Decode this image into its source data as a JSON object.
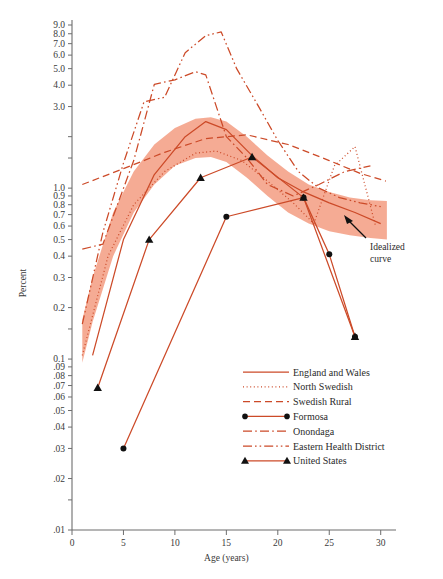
{
  "chart_data": {
    "type": "line",
    "title": "",
    "xlabel": "Age (years)",
    "ylabel": "Percent",
    "xlim": [
      0,
      31
    ],
    "ylim": [
      0.01,
      9.5
    ],
    "yscale": "log",
    "grid": false,
    "legend_position": "inside-bottom-right",
    "annotations": [
      {
        "text": "Idealized curve",
        "line1": "Idealized",
        "line2": "curve",
        "x": 30.2,
        "y": 0.47
      }
    ],
    "xticks": [
      0,
      5,
      10,
      15,
      20,
      25,
      30
    ],
    "xtick_labels": [
      "0",
      "5",
      "10",
      "15",
      "20",
      "25",
      "30"
    ],
    "yticks": [
      9.0,
      8.0,
      7.0,
      6.0,
      5.0,
      4.0,
      3.0,
      2.0,
      1.5,
      1.0,
      0.9,
      0.8,
      0.7,
      0.6,
      0.5,
      0.4,
      0.3,
      0.2,
      0.15,
      0.1,
      0.09,
      0.08,
      0.07,
      0.06,
      0.05,
      0.04,
      0.03,
      0.02,
      0.015,
      0.01
    ],
    "ytick_labels": [
      "9.0",
      "8.0",
      "7.0",
      "6.0",
      "5.0",
      "4.0",
      "3.0",
      "",
      "",
      "1.0",
      "0.9",
      "0.8",
      "0.7",
      "0.6",
      "0.5",
      "0.4",
      "0.3",
      "0.2",
      "",
      "0.1",
      ".09",
      ".08",
      ".07",
      ".06",
      ".05",
      ".04",
      ".03",
      ".02",
      "",
      ".01"
    ],
    "band": {
      "name": "Idealized curve band",
      "color": "#F4A78E",
      "upper": [
        [
          1.0,
          0.17
        ],
        [
          2.0,
          0.3
        ],
        [
          4.0,
          0.72
        ],
        [
          6.0,
          1.25
        ],
        [
          8.0,
          1.8
        ],
        [
          10.0,
          2.25
        ],
        [
          12.0,
          2.55
        ],
        [
          13.5,
          2.6
        ],
        [
          15.0,
          2.45
        ],
        [
          17.0,
          2.0
        ],
        [
          19.0,
          1.55
        ],
        [
          21.0,
          1.25
        ],
        [
          23.0,
          1.05
        ],
        [
          25.0,
          0.95
        ],
        [
          27.0,
          0.88
        ],
        [
          29.0,
          0.85
        ],
        [
          30.6,
          0.84
        ]
      ],
      "lower": [
        [
          1.0,
          0.095
        ],
        [
          2.0,
          0.165
        ],
        [
          4.0,
          0.4
        ],
        [
          6.0,
          0.72
        ],
        [
          8.0,
          1.05
        ],
        [
          10.0,
          1.35
        ],
        [
          12.0,
          1.5
        ],
        [
          13.5,
          1.52
        ],
        [
          15.0,
          1.42
        ],
        [
          17.0,
          1.15
        ],
        [
          19.0,
          0.9
        ],
        [
          21.0,
          0.72
        ],
        [
          23.0,
          0.62
        ],
        [
          25.0,
          0.56
        ],
        [
          27.0,
          0.53
        ],
        [
          29.0,
          0.51
        ],
        [
          30.6,
          0.5
        ]
      ]
    },
    "series": [
      {
        "name": "England and Wales",
        "style": "solid",
        "marker": "none",
        "color": "#CC4A28",
        "points": [
          [
            2.0,
            0.105
          ],
          [
            5.0,
            0.5
          ],
          [
            8.0,
            1.2
          ],
          [
            11.0,
            2.0
          ],
          [
            13.0,
            2.45
          ],
          [
            15.0,
            2.2
          ],
          [
            17.5,
            1.55
          ],
          [
            20.0,
            1.15
          ],
          [
            22.5,
            0.95
          ],
          [
            25.0,
            0.82
          ],
          [
            27.5,
            0.72
          ],
          [
            30.0,
            0.62
          ]
        ]
      },
      {
        "name": "North Swedish",
        "style": "dotted",
        "marker": "none",
        "color": "#CC4A28",
        "points": [
          [
            1.0,
            0.105
          ],
          [
            3.5,
            0.4
          ],
          [
            6.0,
            0.8
          ],
          [
            9.0,
            1.25
          ],
          [
            12.0,
            1.6
          ],
          [
            14.0,
            1.65
          ],
          [
            16.5,
            1.45
          ],
          [
            19.0,
            1.1
          ],
          [
            21.5,
            0.82
          ],
          [
            23.5,
            0.62
          ],
          [
            25.5,
            1.35
          ],
          [
            27.5,
            1.75
          ],
          [
            29.5,
            0.6
          ]
        ]
      },
      {
        "name": "Swedish Rural",
        "style": "dashed",
        "marker": "none",
        "color": "#CC4A28",
        "points": [
          [
            1.0,
            1.05
          ],
          [
            5.0,
            1.3
          ],
          [
            9.0,
            1.62
          ],
          [
            13.0,
            1.95
          ],
          [
            17.0,
            2.05
          ],
          [
            21.0,
            1.8
          ],
          [
            25.0,
            1.45
          ],
          [
            28.0,
            1.22
          ],
          [
            30.5,
            1.1
          ]
        ]
      },
      {
        "name": "Formosa",
        "style": "solid",
        "marker": "circle",
        "color": "#CC4A28",
        "points": [
          [
            5.0,
            0.03
          ],
          [
            15.0,
            0.68
          ],
          [
            22.5,
            0.88
          ],
          [
            25.0,
            0.41
          ],
          [
            27.5,
            0.135
          ]
        ]
      },
      {
        "name": "Onondaga",
        "style": "dashdot",
        "marker": "none",
        "color": "#CC4A28",
        "points": [
          [
            1.0,
            0.44
          ],
          [
            3.0,
            0.47
          ],
          [
            6.0,
            1.45
          ],
          [
            8.0,
            4.05
          ],
          [
            10.0,
            4.3
          ],
          [
            12.0,
            4.8
          ],
          [
            13.0,
            4.6
          ],
          [
            15.0,
            2.0
          ],
          [
            17.0,
            1.5
          ],
          [
            19.0,
            1.05
          ],
          [
            21.5,
            0.9
          ],
          [
            24.0,
            1.05
          ],
          [
            26.5,
            1.25
          ],
          [
            29.0,
            1.35
          ]
        ]
      },
      {
        "name": "Eastern Health District",
        "style": "dashdotdot",
        "marker": "none",
        "color": "#CC4A28",
        "points": [
          [
            1.0,
            0.16
          ],
          [
            3.0,
            0.55
          ],
          [
            5.0,
            1.4
          ],
          [
            7.0,
            3.2
          ],
          [
            9.0,
            3.4
          ],
          [
            11.0,
            6.2
          ],
          [
            13.0,
            7.8
          ],
          [
            14.5,
            8.2
          ],
          [
            16.0,
            5.0
          ],
          [
            18.0,
            3.1
          ],
          [
            20.0,
            1.9
          ],
          [
            22.0,
            1.25
          ],
          [
            24.0,
            1.0
          ],
          [
            26.0,
            0.88
          ],
          [
            28.0,
            0.82
          ],
          [
            30.0,
            0.78
          ]
        ]
      },
      {
        "name": "United States",
        "style": "solid",
        "marker": "triangle",
        "color": "#CC4A28",
        "points": [
          [
            2.5,
            0.068
          ],
          [
            7.5,
            0.5
          ],
          [
            12.5,
            1.15
          ],
          [
            17.5,
            1.52
          ],
          [
            22.5,
            0.88
          ],
          [
            27.5,
            0.135
          ]
        ]
      }
    ]
  },
  "legend": {
    "items": [
      {
        "label": "England and Wales",
        "style": "solid",
        "marker": "none"
      },
      {
        "label": "North Swedish",
        "style": "dotted",
        "marker": "none"
      },
      {
        "label": "Swedish Rural",
        "style": "dashed",
        "marker": "none"
      },
      {
        "label": "Formosa",
        "style": "solid",
        "marker": "circle"
      },
      {
        "label": "Onondaga",
        "style": "dashdot",
        "marker": "none"
      },
      {
        "label": "Eastern Health District",
        "style": "dashdotdot",
        "marker": "none"
      },
      {
        "label": "United States",
        "style": "solid",
        "marker": "triangle"
      }
    ]
  },
  "colors": {
    "line": "#CC4A28",
    "band": "#F4A78E",
    "axis": "#6d6d6d",
    "text": "#2b2b2b",
    "marker": "#111111"
  }
}
